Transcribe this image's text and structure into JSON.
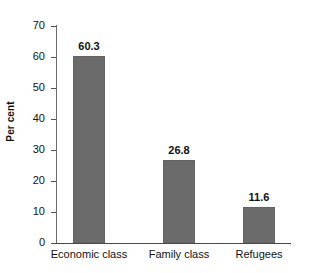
{
  "chart_data": {
    "type": "bar",
    "title": "",
    "subtitle": "",
    "xlabel": "",
    "ylabel": "Per cent",
    "categories": [
      "Economic class",
      "Family class",
      "Refugees"
    ],
    "values": [
      60.3,
      26.8,
      11.6
    ],
    "value_labels": [
      "60.3",
      "26.8",
      "11.6"
    ],
    "ylim": [
      0,
      70
    ],
    "ytick_labels": [
      "0",
      "10",
      "20",
      "30",
      "40",
      "50",
      "60",
      "70"
    ],
    "ytick_values": [
      0,
      10,
      20,
      30,
      40,
      50,
      60,
      70
    ],
    "grid": false,
    "legend": false,
    "legend_position": "none",
    "bar_color": "#6b6b6b",
    "background_color": "#ffffff",
    "axis_color": "#4a4a4a",
    "text_color": "#111111"
  }
}
